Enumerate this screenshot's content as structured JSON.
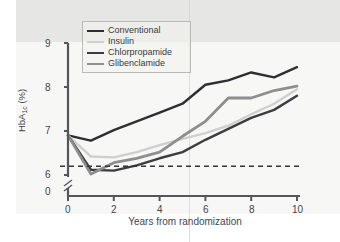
{
  "figure": {
    "background_color": "#fdfdfc",
    "tint_color": "#e3e3e1"
  },
  "axis": {
    "y_label": "HbA",
    "y_label_sub": "1c",
    "y_label_unit": " (%)",
    "y_ticks": [
      "9",
      "8",
      "7",
      "6",
      "0"
    ],
    "x_ticks": [
      "0",
      "2",
      "4",
      "6",
      "8",
      "10"
    ],
    "x_label": "Years from randomization",
    "axis_color": "#55555a",
    "break_marker": "//"
  },
  "legend": {
    "items": [
      {
        "label": "Conventional",
        "color": "#2e2e33",
        "width": 2.6
      },
      {
        "label": "Insulin",
        "color": "#cfcfcb",
        "width": 2.6
      },
      {
        "label": "Chlorpropamide",
        "color": "#3c3c42",
        "width": 2.6
      },
      {
        "label": "Glibenclamide",
        "color": "#8e8e8e",
        "width": 2.8
      }
    ]
  },
  "chart_data": {
    "type": "line",
    "title": "",
    "xlabel": "Years from randomization",
    "ylabel": "HbA1c (%)",
    "xlim": [
      0,
      10
    ],
    "ylim": [
      6.0,
      9.0
    ],
    "y_axis_broken": true,
    "y_break_below": 6.0,
    "grid": false,
    "legend_position": "top-left",
    "x": [
      0,
      1,
      2,
      3,
      4,
      5,
      6,
      7,
      8,
      9,
      10
    ],
    "series": [
      {
        "name": "Conventional",
        "color": "#2e2e33",
        "values": [
          6.9,
          6.78,
          7.02,
          7.22,
          7.42,
          7.62,
          8.05,
          8.15,
          8.33,
          8.22,
          8.45
        ]
      },
      {
        "name": "Insulin",
        "color": "#cfcfcb",
        "values": [
          6.9,
          6.42,
          6.4,
          6.52,
          6.68,
          6.82,
          6.95,
          7.12,
          7.38,
          7.62,
          7.95
        ]
      },
      {
        "name": "Chlorpropamide",
        "color": "#3c3c42",
        "values": [
          6.9,
          6.12,
          6.1,
          6.22,
          6.38,
          6.52,
          6.8,
          7.05,
          7.3,
          7.48,
          7.8
        ]
      },
      {
        "name": "Glibenclamide",
        "color": "#8e8e8e",
        "values": [
          6.9,
          6.02,
          6.28,
          6.38,
          6.52,
          6.88,
          7.22,
          7.75,
          7.75,
          7.92,
          8.02
        ]
      }
    ],
    "reference_line": {
      "label": "",
      "value": 6.2,
      "style": "dashed",
      "color": "#33333a"
    }
  }
}
